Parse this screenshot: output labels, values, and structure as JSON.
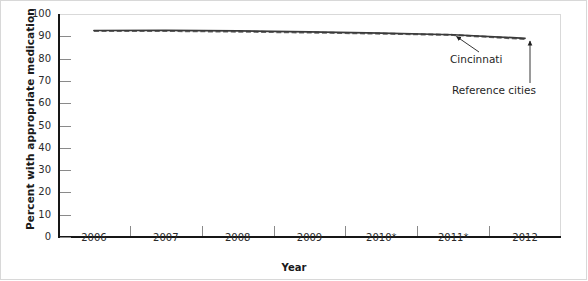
{
  "chart_data": {
    "type": "line",
    "title": "",
    "xlabel": "Year",
    "ylabel": "Percent with appropriate medication",
    "ylim": [
      0,
      100
    ],
    "ytick_step": 10,
    "yticks": [
      100,
      90,
      80,
      70,
      60,
      50,
      40,
      30,
      20,
      10,
      0
    ],
    "categories": [
      "2006",
      "2007",
      "2008",
      "2009",
      "2010*",
      "2011*",
      "2012"
    ],
    "x": [
      2006,
      2007,
      2008,
      2009,
      2010,
      2011,
      2012
    ],
    "grid": false,
    "legend_position": "inline-annotations",
    "series": [
      {
        "name": "Cincinnati",
        "style": "solid",
        "color": "#3a3a3a",
        "values": [
          92.6,
          92.7,
          92.4,
          92.0,
          91.4,
          90.7,
          89.1
        ]
      },
      {
        "name": "Reference cities",
        "style": "dashed",
        "color": "#6b6b6b",
        "values": [
          92.4,
          92.4,
          92.1,
          91.7,
          91.2,
          90.6,
          88.8
        ]
      }
    ],
    "annotations": [
      {
        "text": "Cincinnati",
        "points_to_series": "Cincinnati",
        "at_x": 2010.8
      },
      {
        "text": "Reference cities",
        "points_to_series": "Reference cities",
        "at_x": 2011.95
      }
    ]
  },
  "axes": {
    "y_title": "Percent with appropriate medication",
    "x_title": "Year",
    "y_tick_labels": [
      "100",
      "90",
      "80",
      "70",
      "60",
      "50",
      "40",
      "30",
      "20",
      "10",
      "0"
    ],
    "x_tick_labels": [
      "2006",
      "2007",
      "2008",
      "2009",
      "2010*",
      "2011*",
      "2012"
    ]
  },
  "annotations": {
    "cincinnati": "Cincinnati",
    "reference_cities": "Reference cities"
  },
  "colors": {
    "cincinnati_line": "#3a3a3a",
    "reference_line": "#6b6b6b",
    "axis": "#171717",
    "tick": "#8a8a8a",
    "frame": "#d8d8d8",
    "text": "#1f1f1f"
  }
}
